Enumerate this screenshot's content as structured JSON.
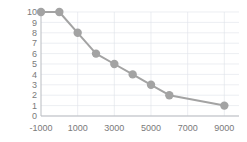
{
  "chart_data": {
    "type": "line",
    "title": "",
    "subtitle": "",
    "xlabel": "",
    "ylabel": "",
    "xlim": [
      -1000,
      9800
    ],
    "ylim": [
      0,
      10
    ],
    "grid": true,
    "legend": false,
    "marker": "circle",
    "x": [
      -1000,
      0,
      1000,
      2000,
      3000,
      4000,
      5000,
      6000,
      9000
    ],
    "y": [
      10,
      10,
      8,
      6,
      5,
      4,
      3,
      2,
      1
    ],
    "series": [
      {
        "name": "",
        "points": [
          {
            "x": -1000,
            "y": 10
          },
          {
            "x": 0,
            "y": 10
          },
          {
            "x": 1000,
            "y": 8
          },
          {
            "x": 2000,
            "y": 6
          },
          {
            "x": 3000,
            "y": 5
          },
          {
            "x": 4000,
            "y": 4
          },
          {
            "x": 5000,
            "y": 3
          },
          {
            "x": 6000,
            "y": 2
          },
          {
            "x": 9000,
            "y": 1
          }
        ],
        "line_color": "#a3a3a3",
        "marker_color": "#a3a3a3"
      }
    ],
    "xticks": [
      -1000,
      1000,
      3000,
      5000,
      7000,
      9000
    ],
    "xtick_labels": [
      "-1000",
      "1000",
      "3000",
      "5000",
      "7000",
      "9000"
    ],
    "yticks": [
      0,
      1,
      2,
      3,
      4,
      5,
      6,
      7,
      8,
      9,
      10
    ],
    "ytick_labels": [
      "0",
      "1",
      "2",
      "3",
      "4",
      "5",
      "6",
      "7",
      "8",
      "9",
      "10"
    ],
    "colors": {
      "series": "#a3a3a3",
      "grid": "#dfe3ea",
      "axis": "#b9bcc1",
      "tick_label": "#7a7a7a",
      "background": "#ffffff"
    }
  }
}
